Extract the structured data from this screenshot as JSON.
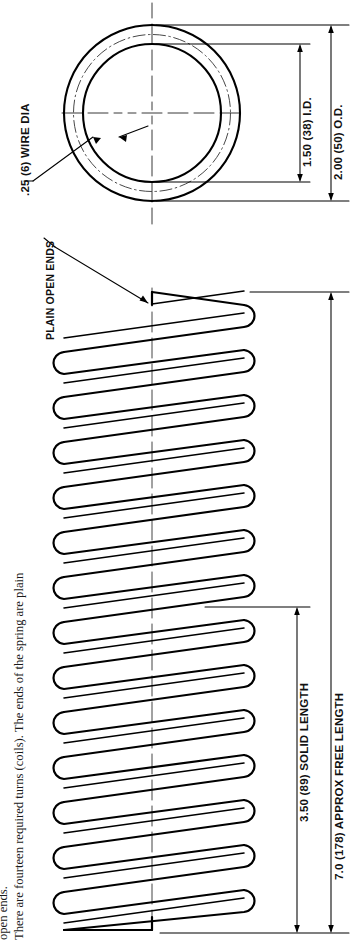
{
  "drawing": {
    "title": "Helical Compression Spring Detail Drawing",
    "line_color": "#000000",
    "background": "#ffffff",
    "views": {
      "end_view": {
        "name": "end-view-circles",
        "outer_label": "2.00 (50) O.D.",
        "inner_label": "1.50 (38) I.D.",
        "wire_label": ".25 (6) WIRE DIA"
      },
      "side_view": {
        "name": "spring-side-view",
        "coil_count": 14,
        "ends_note": "PLAIN OPEN ENDS",
        "solid_length_label": "3.50 (89) SOLID LENGTH",
        "free_length_label": "7.0 (178) APPROX FREE LENGTH"
      }
    },
    "dimensions": [
      {
        "id": "od",
        "label": "2.00 (50) O.D."
      },
      {
        "id": "id",
        "label": "1.50 (38) I.D."
      },
      {
        "id": "wire-dia",
        "label": ".25 (6) WIRE DIA"
      },
      {
        "id": "solid-length",
        "label": "3.50 (89) SOLID LENGTH"
      },
      {
        "id": "free-length",
        "label": "7.0 (178) APPROX FREE LENGTH"
      }
    ],
    "notes": {
      "plain_open_ends": "PLAIN OPEN ENDS",
      "body_line_1": "There are fourteen required turns (coils).  The ends of the spring are plain",
      "body_line_2": "open ends."
    }
  }
}
